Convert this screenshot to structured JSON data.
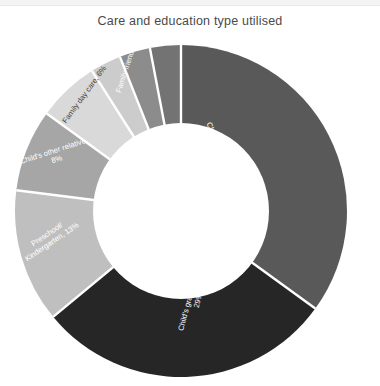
{
  "chart_data": {
    "type": "pie",
    "variant": "donut",
    "title": "Care and education type utilised",
    "xlabel": "",
    "ylabel": "",
    "legend": "none",
    "grid": false,
    "labels_inside": true,
    "hole_ratio": 0.52,
    "categories": [
      "Child care centre",
      "Child's grandparent",
      "Preschool/ Kindergarten",
      "Child's other relative",
      "Family day care",
      "Family friend"
    ],
    "values": [
      35,
      29,
      13,
      8,
      6,
      3
    ],
    "slices": [
      {
        "name": "Child care centre",
        "value": 35,
        "label": "Child care centre, 35%",
        "color": "#595959",
        "text_color": "#ffffff",
        "label_lines": [
          "Child care centre, 35%"
        ]
      },
      {
        "name": "Child's grandparent",
        "value": 29,
        "label": "Child's grandparent, 29%",
        "color": "#262626",
        "text_color": "#ffffff",
        "label_lines": [
          "Child's grandparent,",
          "29%"
        ]
      },
      {
        "name": "Preschool/ Kindergarten",
        "value": 13,
        "label": "Preschool/ Kindergarten, 13%",
        "color": "#bfbfbf",
        "text_color": "#ffffff",
        "label_lines": [
          "Preschool/",
          "Kindergarten, 13%"
        ]
      },
      {
        "name": "Child's other relative",
        "value": 8,
        "label": "Child's other relative, 8%",
        "color": "#a6a6a6",
        "text_color": "#ffffff",
        "label_lines": [
          "Child's other relative,",
          "8%"
        ]
      },
      {
        "name": "Family day care",
        "value": 6,
        "label": "Family day care, 6%",
        "color": "#d9d9d9",
        "text_color": "#595959",
        "label_lines": [
          "Family day care, 6%"
        ]
      },
      {
        "name": "Family friend",
        "value": 3,
        "label": "Family friend, 3%",
        "color": "#cccccc",
        "text_color": "#ffffff",
        "label_lines": [
          "Family friend, 3%"
        ]
      },
      {
        "name": "Other",
        "value": 3,
        "label": "",
        "color": "#8c8c8c",
        "text_color": "#ffffff",
        "label_lines": []
      },
      {
        "name": "Other 2",
        "value": 3,
        "label": "",
        "color": "#737373",
        "text_color": "#ffffff",
        "label_lines": []
      }
    ],
    "colors": {
      "background": "#ffffff",
      "separator": "#ffffff",
      "title": "#4a4a4a"
    }
  },
  "labels": {
    "child_care_centre": "Child care centre, 35%",
    "grandparent_l1": "Child's grandparent,",
    "grandparent_l2": "29%",
    "preschool_l1": "Preschool/",
    "preschool_l2": "Kindergarten, 13%",
    "other_relative_l1": "Child's other relative,",
    "other_relative_l2": "8%",
    "family_day_care": "Family day care, 6%",
    "family_friend": "Family friend, 3%"
  }
}
